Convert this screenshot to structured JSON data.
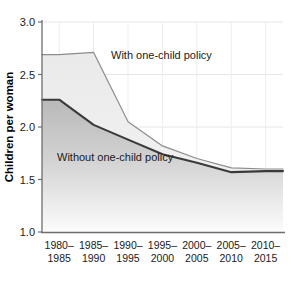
{
  "chart_data": {
    "type": "area",
    "title": "",
    "subtitle": "",
    "xlabel": "",
    "ylabel": "Children per woman",
    "categories": [
      "1980–1985",
      "1985–1990",
      "1990–1995",
      "1995–2000",
      "2000–2005",
      "2005–2010",
      "2010–2015"
    ],
    "category_lines": [
      [
        "1980–",
        "1985"
      ],
      [
        "1985–",
        "1990"
      ],
      [
        "1990–",
        "1995"
      ],
      [
        "1995–",
        "2000"
      ],
      [
        "2000–",
        "2005"
      ],
      [
        "2005–",
        "2010"
      ],
      [
        "2010–",
        "2015"
      ]
    ],
    "series": [
      {
        "name": "With one-child policy",
        "values": [
          2.69,
          2.71,
          2.05,
          1.82,
          1.7,
          1.61,
          1.6
        ],
        "line_color": "#8c8c8c",
        "fill_color": "#ededed"
      },
      {
        "name": "Without one-child policy",
        "values": [
          2.26,
          2.02,
          1.88,
          1.74,
          1.66,
          1.57,
          1.58
        ],
        "line_color": "#3a3a3a",
        "fill_color": "#bdbdbd"
      }
    ],
    "annotations": [
      {
        "text": "With one-child policy",
        "series": "With one-child policy"
      },
      {
        "text": "Without one-child policy",
        "series": "Without one-child policy"
      }
    ],
    "ylim": [
      1.0,
      3.0
    ],
    "yticks": [
      1.0,
      1.5,
      2.0,
      2.5,
      3.0
    ],
    "ytick_labels": [
      "1.0",
      "1.5",
      "2.0",
      "2.5",
      "3.0"
    ],
    "grid": true,
    "legend_position": "inline-annotations"
  },
  "axis": {
    "y_title": "Children per woman",
    "ytick_labels": [
      "3.0",
      "2.5",
      "2.0",
      "1.5",
      "1.0"
    ]
  },
  "colors": {
    "axis_line": "#6e6e6e",
    "grid_line": "#e4e4e4",
    "upper_line": "#8c8c8c",
    "upper_fill": "#ededed",
    "lower_line": "#3a3a3a",
    "lower_fill_top": "#bdbdbd",
    "lower_fill_bottom": "#fbfbfb",
    "text": "#1a1a1a",
    "background": "#ffffff"
  }
}
